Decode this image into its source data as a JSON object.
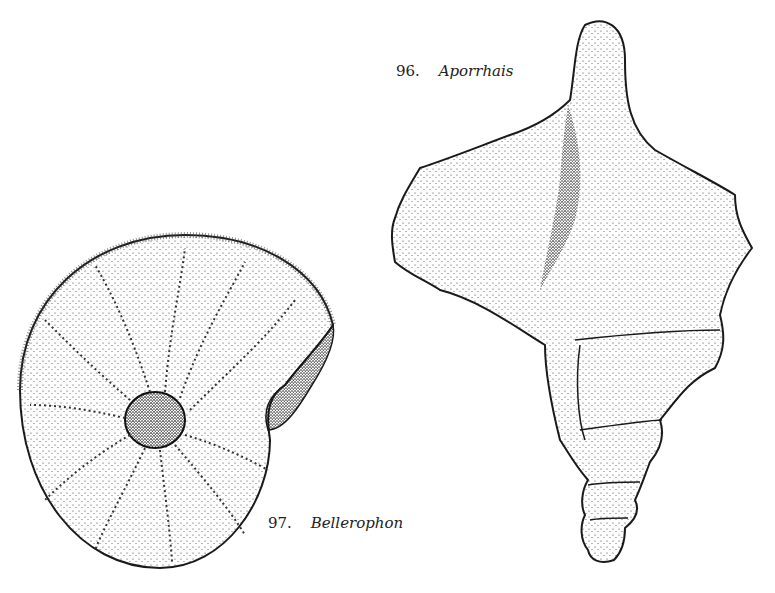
{
  "figures": [
    {
      "number": "96.",
      "name": "Aporrhais",
      "caption_position": {
        "x": 396,
        "y": 62
      }
    },
    {
      "number": "97.",
      "name": "Bellerophon",
      "caption_position": {
        "x": 268,
        "y": 514
      }
    }
  ],
  "colors": {
    "ink": "#1a1a1a",
    "paper": "#ffffff"
  }
}
